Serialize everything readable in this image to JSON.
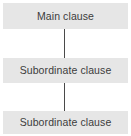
{
  "diagram": {
    "type": "flowchart",
    "orientation": "vertical",
    "colors": {
      "background": "#ffffff",
      "node_fill": "#e6e6e6",
      "node_text": "#3c3c3c",
      "connector": "#4a4a4a"
    },
    "nodes": [
      {
        "id": "main",
        "label": "Main clause"
      },
      {
        "id": "sub-1",
        "label": "Subordinate clause"
      },
      {
        "id": "sub-2",
        "label": "Subordinate clause"
      }
    ],
    "connectors": [
      {
        "id": "connector-1",
        "from": "main",
        "to": "sub-1"
      },
      {
        "id": "connector-2",
        "from": "sub-1",
        "to": "sub-2"
      }
    ]
  }
}
